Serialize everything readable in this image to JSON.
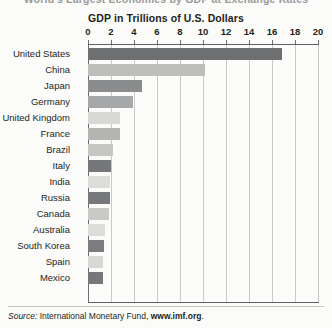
{
  "cropped_heading": "World's Largest Economies by GDP at Exchange Rates",
  "source": {
    "label": "Source:",
    "body": " International Monetary Fund, ",
    "url": "www.imf.org",
    "period": "."
  },
  "chart_data": {
    "type": "bar",
    "orientation": "horizontal",
    "title": "GDP in Trillions of U.S. Dollars",
    "xlabel": "",
    "ylabel": "",
    "xlim": [
      0,
      20
    ],
    "xticks": [
      0,
      2,
      4,
      6,
      8,
      10,
      12,
      14,
      16,
      18,
      20
    ],
    "tick_labels": [
      "0",
      "2",
      "4",
      "6",
      "8",
      "10",
      "12",
      "14",
      "16",
      "18",
      "20"
    ],
    "grid": "vertical",
    "legend": "none",
    "categories": [
      "United States",
      "China",
      "Japan",
      "Germany",
      "United Kingdom",
      "France",
      "Brazil",
      "Italy",
      "India",
      "Russia",
      "Canada",
      "Australia",
      "South Korea",
      "Spain",
      "Mexico"
    ],
    "values": [
      16.9,
      10.2,
      4.7,
      3.9,
      2.8,
      2.8,
      2.2,
      2.0,
      1.9,
      1.9,
      1.8,
      1.5,
      1.4,
      1.3,
      1.3
    ],
    "bar_colors": [
      "#6e6f71",
      "#bdbdbb",
      "#8b8c8e",
      "#a6a7a8",
      "#d8d8d6",
      "#b4b5b3",
      "#c6c6c4",
      "#76777a",
      "#dcdcda",
      "#77787b",
      "#c9c9c7",
      "#dcdcda",
      "#7b7c7f",
      "#d8d8d6",
      "#76777a"
    ]
  },
  "colors": {
    "background": "#fbfbfa",
    "text": "#231f20",
    "gridline": "#c9c9c7",
    "axis": "#5e5f61"
  }
}
